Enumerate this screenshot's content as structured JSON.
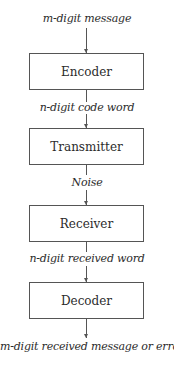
{
  "diagram": {
    "type": "flowchart",
    "direction": "top-to-bottom",
    "nodes": [
      {
        "id": "encoder",
        "label": "Encoder"
      },
      {
        "id": "transmitter",
        "label": "Transmitter"
      },
      {
        "id": "receiver",
        "label": "Receiver"
      },
      {
        "id": "decoder",
        "label": "Decoder"
      }
    ],
    "edge_labels": {
      "input": "m-digit message",
      "encoder_to_transmitter": "n-digit code word",
      "transmitter_to_receiver": "Noise",
      "receiver_to_decoder": "n-digit received word",
      "output": "m-digit received message or error"
    },
    "colors": {
      "stroke": "#555555",
      "text": "#2b2b2b",
      "background": "#ffffff"
    }
  }
}
